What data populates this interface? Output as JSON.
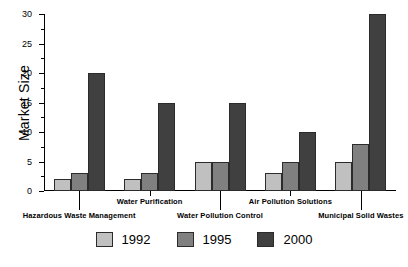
{
  "chart_data": {
    "type": "bar",
    "title": "",
    "xlabel": "",
    "ylabel": "Market Size",
    "ylim": [
      0,
      30
    ],
    "ytick_step": 5,
    "yticks": [
      0,
      5,
      10,
      15,
      20,
      25,
      30
    ],
    "ytick_labels": [
      "0",
      "5",
      "10",
      "15",
      "20",
      "25",
      "30"
    ],
    "grid": false,
    "legend_position": "bottom",
    "categories": [
      "Hazardous Waste Management",
      "Water Purification",
      "Water Pollution Control",
      "Air Pollution Solutions",
      "Municipal Solid Wastes"
    ],
    "series": [
      {
        "name": "1992",
        "color": "#c0c0c0",
        "values": [
          2,
          2,
          5,
          3,
          5
        ]
      },
      {
        "name": "1995",
        "color": "#808080",
        "values": [
          3,
          3,
          5,
          5,
          8
        ]
      },
      {
        "name": "2000",
        "color": "#404040",
        "values": [
          20,
          15,
          15,
          10,
          30
        ]
      }
    ]
  },
  "legend": {
    "items": [
      {
        "label": "1992",
        "color": "#c0c0c0"
      },
      {
        "label": "1995",
        "color": "#808080"
      },
      {
        "label": "2000",
        "color": "#404040"
      }
    ]
  }
}
